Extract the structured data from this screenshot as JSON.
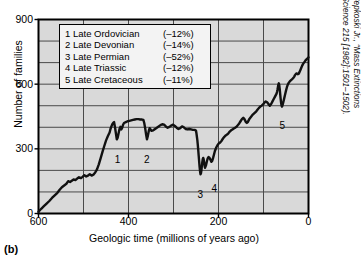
{
  "panel_label": "(b)",
  "chart_data": {
    "type": "line",
    "title": "",
    "xlabel": "Geologic time (millions of years ago)",
    "ylabel": "Number of families",
    "xlim": [
      600,
      0
    ],
    "ylim": [
      0,
      900
    ],
    "x_ticks": [
      600,
      400,
      200,
      0
    ],
    "y_ticks": [
      0,
      300,
      600,
      900
    ],
    "x_gridlines": [
      600,
      500,
      400,
      300,
      200,
      100,
      0
    ],
    "y_gridlines": [
      0,
      100,
      200,
      300,
      400,
      500,
      600,
      700,
      800,
      900
    ],
    "grid": true,
    "legend_position": "inside-top-left",
    "series": [
      {
        "name": "Marine animal families",
        "points": [
          [
            600,
            8
          ],
          [
            594,
            22
          ],
          [
            588,
            34
          ],
          [
            582,
            46
          ],
          [
            576,
            58
          ],
          [
            570,
            72
          ],
          [
            564,
            84
          ],
          [
            558,
            96
          ],
          [
            553,
            110
          ],
          [
            548,
            122
          ],
          [
            543,
            130
          ],
          [
            538,
            138
          ],
          [
            534,
            150
          ],
          [
            530,
            146
          ],
          [
            526,
            152
          ],
          [
            522,
            158
          ],
          [
            518,
            155
          ],
          [
            514,
            162
          ],
          [
            510,
            168
          ],
          [
            506,
            164
          ],
          [
            502,
            170
          ],
          [
            498,
            178
          ],
          [
            494,
            172
          ],
          [
            490,
            176
          ],
          [
            486,
            182
          ],
          [
            482,
            176
          ],
          [
            478,
            180
          ],
          [
            474,
            190
          ],
          [
            470,
            205
          ],
          [
            466,
            228
          ],
          [
            462,
            256
          ],
          [
            458,
            285
          ],
          [
            454,
            312
          ],
          [
            450,
            338
          ],
          [
            446,
            358
          ],
          [
            442,
            376
          ],
          [
            440,
            392
          ],
          [
            438,
            404
          ],
          [
            436,
            414
          ],
          [
            434,
            420
          ],
          [
            432,
            424
          ],
          [
            430,
            400
          ],
          [
            428,
            372
          ],
          [
            426,
            344
          ],
          [
            424,
            352
          ],
          [
            422,
            372
          ],
          [
            420,
            392
          ],
          [
            418,
            402
          ],
          [
            416,
            390
          ],
          [
            414,
            398
          ],
          [
            412,
            412
          ],
          [
            410,
            420
          ],
          [
            406,
            424
          ],
          [
            402,
            428
          ],
          [
            398,
            430
          ],
          [
            394,
            432
          ],
          [
            390,
            434
          ],
          [
            386,
            436
          ],
          [
            382,
            438
          ],
          [
            378,
            438
          ],
          [
            374,
            436
          ],
          [
            370,
            436
          ],
          [
            367,
            434
          ],
          [
            365,
            420
          ],
          [
            363,
            396
          ],
          [
            361,
            368
          ],
          [
            359,
            344
          ],
          [
            357,
            360
          ],
          [
            355,
            382
          ],
          [
            353,
            396
          ],
          [
            351,
            390
          ],
          [
            349,
            384
          ],
          [
            345,
            386
          ],
          [
            341,
            392
          ],
          [
            337,
            398
          ],
          [
            333,
            404
          ],
          [
            329,
            410
          ],
          [
            325,
            414
          ],
          [
            321,
            412
          ],
          [
            317,
            404
          ],
          [
            313,
            398
          ],
          [
            309,
            402
          ],
          [
            305,
            408
          ],
          [
            301,
            412
          ],
          [
            297,
            406
          ],
          [
            293,
            398
          ],
          [
            289,
            392
          ],
          [
            285,
            396
          ],
          [
            281,
            404
          ],
          [
            277,
            400
          ],
          [
            273,
            392
          ],
          [
            269,
            390
          ],
          [
            265,
            392
          ],
          [
            261,
            390
          ],
          [
            257,
            388
          ],
          [
            253,
            388
          ],
          [
            251,
            386
          ],
          [
            250,
            384
          ],
          [
            249,
            372
          ],
          [
            248,
            356
          ],
          [
            247,
            340
          ],
          [
            246,
            318
          ],
          [
            245,
            294
          ],
          [
            244,
            268
          ],
          [
            243,
            242
          ],
          [
            242,
            216
          ],
          [
            241,
            196
          ],
          [
            240,
            182
          ],
          [
            239,
            186
          ],
          [
            238,
            200
          ],
          [
            237,
            220
          ],
          [
            236,
            238
          ],
          [
            235,
            252
          ],
          [
            234,
            258
          ],
          [
            233,
            252
          ],
          [
            232,
            238
          ],
          [
            231,
            222
          ],
          [
            230,
            212
          ],
          [
            228,
            222
          ],
          [
            226,
            240
          ],
          [
            224,
            256
          ],
          [
            222,
            262
          ],
          [
            220,
            258
          ],
          [
            218,
            250
          ],
          [
            216,
            240
          ],
          [
            214,
            244
          ],
          [
            212,
            258
          ],
          [
            210,
            274
          ],
          [
            208,
            290
          ],
          [
            205,
            306
          ],
          [
            202,
            318
          ],
          [
            199,
            326
          ],
          [
            196,
            330
          ],
          [
            193,
            338
          ],
          [
            190,
            348
          ],
          [
            187,
            356
          ],
          [
            184,
            362
          ],
          [
            181,
            366
          ],
          [
            178,
            372
          ],
          [
            175,
            380
          ],
          [
            172,
            386
          ],
          [
            169,
            390
          ],
          [
            166,
            394
          ],
          [
            163,
            398
          ],
          [
            160,
            402
          ],
          [
            157,
            410
          ],
          [
            154,
            418
          ],
          [
            151,
            428
          ],
          [
            148,
            438
          ],
          [
            145,
            444
          ],
          [
            143,
            440
          ],
          [
            141,
            432
          ],
          [
            139,
            424
          ],
          [
            137,
            420
          ],
          [
            135,
            424
          ],
          [
            133,
            432
          ],
          [
            131,
            440
          ],
          [
            128,
            448
          ],
          [
            125,
            456
          ],
          [
            122,
            462
          ],
          [
            119,
            468
          ],
          [
            116,
            474
          ],
          [
            113,
            482
          ],
          [
            110,
            490
          ],
          [
            107,
            496
          ],
          [
            104,
            500
          ],
          [
            101,
            506
          ],
          [
            98,
            514
          ],
          [
            95,
            520
          ],
          [
            92,
            516
          ],
          [
            89,
            508
          ],
          [
            86,
            500
          ],
          [
            83,
            508
          ],
          [
            80,
            520
          ],
          [
            77,
            532
          ],
          [
            75,
            540
          ],
          [
            73,
            548
          ],
          [
            71,
            556
          ],
          [
            70,
            564
          ],
          [
            69,
            574
          ],
          [
            68,
            586
          ],
          [
            67,
            598
          ],
          [
            66,
            604
          ],
          [
            65,
            596
          ],
          [
            64,
            578
          ],
          [
            63,
            556
          ],
          [
            62,
            534
          ],
          [
            61,
            516
          ],
          [
            60,
            502
          ],
          [
            59,
            496
          ],
          [
            58,
            500
          ],
          [
            56,
            516
          ],
          [
            54,
            534
          ],
          [
            52,
            552
          ],
          [
            50,
            570
          ],
          [
            48,
            586
          ],
          [
            46,
            598
          ],
          [
            44,
            606
          ],
          [
            42,
            612
          ],
          [
            40,
            616
          ],
          [
            38,
            620
          ],
          [
            36,
            624
          ],
          [
            34,
            628
          ],
          [
            32,
            634
          ],
          [
            30,
            642
          ],
          [
            28,
            648
          ],
          [
            26,
            650
          ],
          [
            24,
            646
          ],
          [
            22,
            648
          ],
          [
            20,
            656
          ],
          [
            18,
            666
          ],
          [
            16,
            676
          ],
          [
            14,
            686
          ],
          [
            12,
            694
          ],
          [
            10,
            700
          ],
          [
            8,
            706
          ],
          [
            6,
            712
          ],
          [
            4,
            716
          ],
          [
            2,
            720
          ],
          [
            0,
            724
          ]
        ]
      }
    ],
    "annotations": [
      {
        "label": "1",
        "x": 424,
        "y": 344,
        "dx": 0,
        "dy": 16
      },
      {
        "label": "2",
        "x": 359,
        "y": 344,
        "dx": 0,
        "dy": 16
      },
      {
        "label": "3",
        "x": 240,
        "y": 182,
        "dx": 0,
        "dy": 16
      },
      {
        "label": "4",
        "x": 231,
        "y": 212,
        "dx": 10,
        "dy": 16
      },
      {
        "label": "5",
        "x": 60,
        "y": 502,
        "dx": 1,
        "dy": 16
      }
    ]
  },
  "legend": {
    "rows": [
      {
        "index_name": "1 Late Ordovician",
        "pct": "(–12%)"
      },
      {
        "index_name": "2 Late Devonian",
        "pct": "(–14%)"
      },
      {
        "index_name": "3 Late Permian",
        "pct": "(–52%)"
      },
      {
        "index_name": "4 Late Triassic",
        "pct": "(–12%)"
      },
      {
        "index_name": "5 Late Cretaceous",
        "pct": "(–11%)"
      }
    ]
  },
  "source_note": "(Source: D.M. Raup and J.J. Sepkoski Jr., “Mass Extinctions in the Marine Fossil Record,” Science 215 [1982]:1501–1502).",
  "colors": {
    "plot_background": "#d9d9d9",
    "grid": "#4a4a4a",
    "axis": "#000000",
    "curve": "#111111",
    "legend_background": "#f3f3f3"
  }
}
